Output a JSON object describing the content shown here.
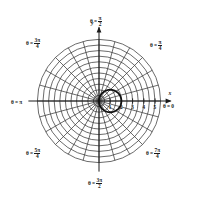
{
  "figure": {
    "background_color": "#ffffff",
    "ink_color": "#1a1a1a",
    "grid_color": "#3a3a3a"
  },
  "axes": {
    "x_label": "x",
    "y_label": "y",
    "x_ticks": [
      "1",
      "2",
      "3",
      "4",
      "5"
    ],
    "x_tick_values": [
      1,
      2,
      3,
      4,
      5
    ],
    "center": {
      "x": 99,
      "y": 101
    },
    "unit_px": 11.2
  },
  "angle_labels": [
    {
      "name": "theta-0",
      "prefix": "θ =",
      "value": "0",
      "kind": "plain",
      "angle_deg": 0,
      "top": 104,
      "left": 163
    },
    {
      "name": "theta-pi-4",
      "prefix": "θ =",
      "num": "π",
      "den": "4",
      "kind": "frac",
      "angle_deg": 45,
      "top": 40,
      "left": 150
    },
    {
      "name": "theta-pi-2",
      "prefix": "θ =",
      "num": "π",
      "den": "2",
      "kind": "frac",
      "angle_deg": 90,
      "top": 16,
      "left": 90
    },
    {
      "name": "theta-3pi-4",
      "prefix": "θ =",
      "num": "3π",
      "den": "4",
      "kind": "frac",
      "angle_deg": 135,
      "top": 38,
      "left": 26
    },
    {
      "name": "theta-pi",
      "prefix": "θ =",
      "value": "π",
      "kind": "plain",
      "angle_deg": 180,
      "top": 100,
      "left": 11
    },
    {
      "name": "theta-5pi-4",
      "prefix": "θ =",
      "num": "5π",
      "den": "4",
      "kind": "frac",
      "angle_deg": 225,
      "top": 148,
      "left": 26
    },
    {
      "name": "theta-3pi-2",
      "prefix": "θ =",
      "num": "3π",
      "den": "2",
      "kind": "frac",
      "angle_deg": 270,
      "top": 178,
      "left": 88
    },
    {
      "name": "theta-7pi-4",
      "prefix": "θ =",
      "num": "7π",
      "den": "4",
      "kind": "frac",
      "angle_deg": 315,
      "top": 148,
      "left": 146
    }
  ],
  "chart_data": {
    "type": "line",
    "coordinate_system": "polar",
    "xlabel": "x",
    "ylabel": "y",
    "grid": true,
    "legend": "none",
    "rlim": [
      0,
      5.5
    ],
    "r_gridlines": [
      0.5,
      1.0,
      1.5,
      2.0,
      2.5,
      3.0,
      3.5,
      4.0,
      4.5,
      5.0,
      5.5
    ],
    "theta_gridlines_deg": [
      0,
      15,
      30,
      45,
      60,
      75,
      90,
      105,
      120,
      135,
      150,
      165,
      180,
      195,
      210,
      225,
      240,
      255,
      270,
      285,
      300,
      315,
      330,
      345
    ],
    "tick_labels": [
      "1",
      "2",
      "3",
      "4",
      "5"
    ],
    "annotations": [
      "θ = 0",
      "θ = π/4",
      "θ = π/2",
      "θ = 3π/4",
      "θ = π",
      "θ = 5π/4",
      "θ = 3π/2",
      "θ = 7π/4"
    ],
    "series": [
      {
        "name": "r = 2 cos(theta)",
        "equation": "r = 2 cos(θ)",
        "shape": "circle through origin, centered at (1, 0), radius 1",
        "max_r": 2,
        "stroke": "#111111",
        "linewidth": 1.8,
        "theta_deg": [
          0,
          15,
          30,
          45,
          60,
          75,
          90,
          105,
          120,
          135,
          150,
          165,
          180
        ],
        "r": [
          2.0,
          1.93,
          1.73,
          1.41,
          1.0,
          0.52,
          0.0,
          -0.52,
          -1.0,
          -1.41,
          -1.73,
          -1.93,
          -2.0
        ]
      }
    ]
  }
}
